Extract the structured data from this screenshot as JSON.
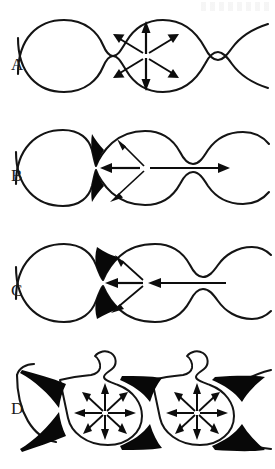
{
  "figure": {
    "background_color": "#ffffff",
    "line_color": "#141414",
    "fill_color": "#080808",
    "arrow_color": "#0d0d0d",
    "width": 275,
    "height": 469,
    "panel_count": 4
  },
  "panels": [
    {
      "id": "a",
      "label": "A",
      "description": "Symmetric bead with six radiating arrows; thin open necks, no constriction fill",
      "neck_state": "open",
      "has_wedges": false,
      "has_loop": false,
      "arrow_mode": "radial-outward",
      "arrow_count": 6,
      "arrow_directions": [
        "up",
        "up-left",
        "up-right",
        "down",
        "down-left",
        "down-right"
      ],
      "axial_arrow": "none"
    },
    {
      "id": "b",
      "label": "B",
      "description": "Constricted neck with filled black wedges; long bidirectional axial arrow and two oblique arrows",
      "neck_state": "constricted",
      "has_wedges": true,
      "has_loop": false,
      "arrow_mode": "axial-bidirectional",
      "arrow_count": 4,
      "arrow_directions": [
        "left",
        "right",
        "up-right",
        "down-right"
      ],
      "axial_arrow": "double-headed"
    },
    {
      "id": "c",
      "label": "C",
      "description": "Constricted neck with filled black wedges; single leftward axial arrow driving flow toward the bead",
      "neck_state": "constricted",
      "has_wedges": true,
      "has_loop": false,
      "arrow_mode": "axial-unidirectional",
      "arrow_count": 4,
      "arrow_directions": [
        "left",
        "up-left",
        "down-left",
        "left-long"
      ],
      "axial_arrow": "single-headed-left"
    },
    {
      "id": "d",
      "label": "D",
      "description": "Two fully pearled beads with teardrop loop protrusions, heavy black neck wedges, and eight radiating arrows each",
      "neck_state": "pinched",
      "has_wedges": true,
      "has_loop": true,
      "arrow_mode": "radial-outward",
      "arrow_count": 8,
      "arrow_directions": [
        "up",
        "up-right",
        "right",
        "down-right",
        "down",
        "down-left",
        "left",
        "up-left"
      ],
      "bead_count": 2,
      "axial_arrow": "none"
    }
  ]
}
